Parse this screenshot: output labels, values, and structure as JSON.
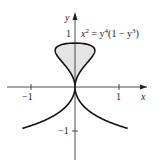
{
  "chart_data": {
    "type": "line",
    "title": "",
    "equation": "x^2 = y^4(1 - y^3)",
    "xlabel": "x",
    "ylabel": "y",
    "x_ticks": [
      "-1",
      "1"
    ],
    "y_ticks": [
      "1",
      "-1"
    ],
    "xlim": [
      -1.6,
      1.6
    ],
    "ylim": [
      -1.4,
      1.5
    ],
    "shaded_region": "loop for 0 <= y <= 1",
    "grid": false
  },
  "labels": {
    "eq_base_x": "x",
    "eq_exp_2": "2",
    "eq_mid": " = y",
    "eq_exp_4": "4",
    "eq_mid2": "(1 − y",
    "eq_exp_3": "3",
    "eq_end": ")",
    "xlabel": "x",
    "ylabel": "y",
    "xt_neg": "−1",
    "xt_pos": "1",
    "yt_pos": "1",
    "yt_neg": "−1"
  }
}
